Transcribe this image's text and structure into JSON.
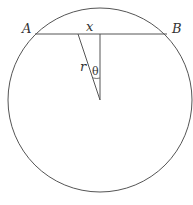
{
  "diagram": {
    "labels": {
      "point_a": "A",
      "point_b": "B",
      "half_chord": "x",
      "radius": "r",
      "angle": "θ"
    },
    "colors": {
      "stroke": "#555555",
      "text": "#333333",
      "background": "#ffffff"
    },
    "circle": {
      "cx": 100,
      "cy": 100,
      "r": 92
    },
    "chord": {
      "y": 34,
      "x1": 35,
      "x2": 167
    }
  }
}
